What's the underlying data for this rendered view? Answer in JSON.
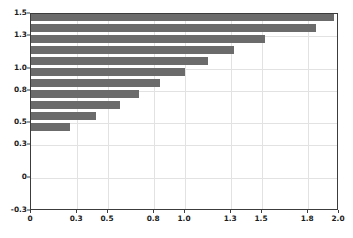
{
  "chart_data": {
    "type": "bar",
    "orientation": "horizontal",
    "title": "",
    "xlabel": "",
    "ylabel": "",
    "xlim": [
      0,
      2.0
    ],
    "ylim": [
      -0.3,
      1.5
    ],
    "grid": true,
    "legend": null,
    "bar_color": "#6b6b6b",
    "background_color": "#ffffff",
    "gridline_color": "#e2e2e2",
    "axis_color": "#3c3c3c",
    "xticks": [
      0,
      0.3,
      0.5,
      0.8,
      1.0,
      1.3,
      1.5,
      1.8,
      2.0
    ],
    "xtick_labels": [
      "0",
      "0.3",
      "0.5",
      "0.8",
      "1.0",
      "1.3",
      "1.5",
      "1.8",
      "2.0"
    ],
    "yticks": [
      -0.3,
      0,
      0.3,
      0.5,
      0.8,
      1.0,
      1.3,
      1.5
    ],
    "ytick_labels": [
      "-0.3",
      "0",
      "0.3",
      "0.5",
      "0.8",
      "1.0",
      "1.3",
      "1.5"
    ],
    "categories": [
      1.47,
      1.37,
      1.27,
      1.17,
      1.07,
      0.97,
      0.87,
      0.77,
      0.67,
      0.57,
      0.47
    ],
    "values": [
      1.97,
      1.85,
      1.52,
      1.32,
      1.15,
      1.0,
      0.84,
      0.7,
      0.58,
      0.42,
      0.25
    ],
    "bars": [
      {
        "y": 1.47,
        "value": 1.97
      },
      {
        "y": 1.37,
        "value": 1.85
      },
      {
        "y": 1.27,
        "value": 1.52
      },
      {
        "y": 1.17,
        "value": 1.32
      },
      {
        "y": 1.07,
        "value": 1.15
      },
      {
        "y": 0.97,
        "value": 1.0
      },
      {
        "y": 0.87,
        "value": 0.84
      },
      {
        "y": 0.77,
        "value": 0.7
      },
      {
        "y": 0.67,
        "value": 0.58
      },
      {
        "y": 0.57,
        "value": 0.42
      },
      {
        "y": 0.47,
        "value": 0.25
      }
    ]
  }
}
